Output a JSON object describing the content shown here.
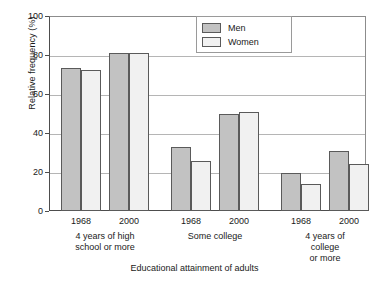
{
  "chart_data": {
    "type": "bar",
    "title": "",
    "xlabel": "Educational attainment of adults",
    "ylabel": "Relative frequency (%)",
    "ylim": [
      0,
      100
    ],
    "yticks": [
      0,
      20,
      40,
      60,
      80,
      100
    ],
    "grid": true,
    "legend_position": "top-center",
    "categories": [
      "4 years of high school or more / 1968",
      "4 years of high school or more / 2000",
      "Some college / 1968",
      "Some college / 2000",
      "4 years of college or more / 1968",
      "4 years of college or more / 2000"
    ],
    "year_labels": [
      "1968",
      "2000",
      "1968",
      "2000",
      "1968",
      "2000"
    ],
    "groups": [
      {
        "label": "4 years of high\nschool or more",
        "years": [
          "1968",
          "2000"
        ]
      },
      {
        "label": "Some college",
        "years": [
          "1968",
          "2000"
        ]
      },
      {
        "label": "4 years of college\nor more",
        "years": [
          "1968",
          "2000"
        ]
      }
    ],
    "series": [
      {
        "name": "Men",
        "color": "#c2c2c2",
        "values": [
          73.5,
          81,
          33,
          50,
          19.5,
          31
        ]
      },
      {
        "name": "Women",
        "color": "#f1f1f1",
        "values": [
          72.5,
          81,
          25.5,
          51,
          14,
          24
        ]
      }
    ]
  },
  "legend": {
    "items": [
      {
        "label": "Men",
        "swatch": "men"
      },
      {
        "label": "Women",
        "swatch": "women"
      }
    ]
  },
  "axis": {
    "y_title": "Relative frequency (%)",
    "x_title": "Educational attainment of adults",
    "y_tick_labels": [
      "100",
      "80",
      "60",
      "40",
      "20",
      "0"
    ]
  }
}
